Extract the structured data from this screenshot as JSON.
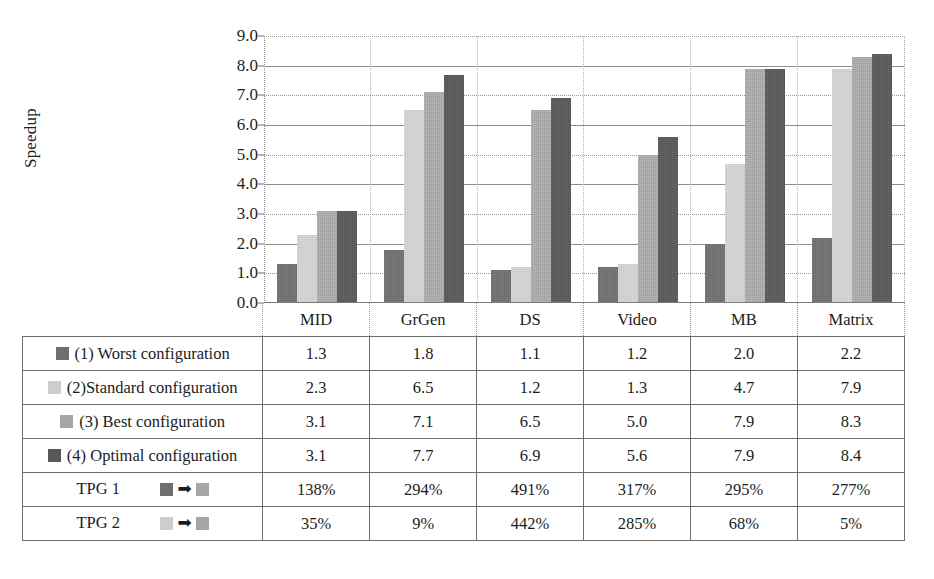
{
  "chart_data": {
    "type": "bar",
    "title": "",
    "xlabel": "",
    "ylabel": "Speedup",
    "ylim": [
      0.0,
      9.0
    ],
    "ytick_step": 1.0,
    "grid": true,
    "legend_position": "table-below",
    "categories": [
      "MID",
      "GrGen",
      "DS",
      "Video",
      "MB",
      "Matrix"
    ],
    "yticks": [
      "9.0",
      "8.0",
      "7.0",
      "6.0",
      "5.0",
      "4.0",
      "3.0",
      "2.0",
      "1.0",
      "0.0"
    ],
    "series": [
      {
        "name": "(1) Worst configuration",
        "color": "#6e6e6e",
        "values": [
          1.3,
          1.8,
          1.1,
          1.2,
          2.0,
          2.2
        ]
      },
      {
        "name": "(2)Standard configuration",
        "color": "#cdcdcd",
        "values": [
          2.3,
          6.5,
          1.2,
          1.3,
          4.7,
          7.9
        ]
      },
      {
        "name": "(3) Best configuration",
        "color": "#a6a6a6",
        "values": [
          3.1,
          7.1,
          6.5,
          5.0,
          7.9,
          8.3
        ]
      },
      {
        "name": "(4) Optimal configuration",
        "color": "#585858",
        "values": [
          3.1,
          7.7,
          6.9,
          5.6,
          7.9,
          8.4
        ]
      }
    ],
    "extra_rows": [
      {
        "name": "TPG 1",
        "from_color": "#6e6e6e",
        "to_color": "#a6a6a6",
        "values": [
          "138%",
          "294%",
          "491%",
          "317%",
          "295%",
          "277%"
        ]
      },
      {
        "name": "TPG 2",
        "from_color": "#cdcdcd",
        "to_color": "#a6a6a6",
        "values": [
          "35%",
          "9%",
          "442%",
          "285%",
          "68%",
          "5%"
        ]
      }
    ]
  },
  "table": {
    "header_blank": "",
    "columns": [
      "MID",
      "GrGen",
      "DS",
      "Video",
      "MB",
      "Matrix"
    ],
    "rows": [
      {
        "label": "(1) Worst configuration",
        "swatch": "s0",
        "values": [
          "1.3",
          "1.8",
          "1.1",
          "1.2",
          "2.0",
          "2.2"
        ]
      },
      {
        "label": "(2)Standard configuration",
        "swatch": "s1",
        "values": [
          "2.3",
          "6.5",
          "1.2",
          "1.3",
          "4.7",
          "7.9"
        ]
      },
      {
        "label": "(3) Best configuration",
        "swatch": "s2",
        "values": [
          "3.1",
          "7.1",
          "6.5",
          "5.0",
          "7.9",
          "8.3"
        ]
      },
      {
        "label": "(4) Optimal configuration",
        "swatch": "s3",
        "values": [
          "3.1",
          "7.7",
          "6.9",
          "5.6",
          "7.9",
          "8.4"
        ]
      }
    ],
    "tpg_rows": [
      {
        "label": "TPG 1",
        "from": "s0",
        "to": "s2",
        "arrow": "➡",
        "values": [
          "138%",
          "294%",
          "491%",
          "317%",
          "295%",
          "277%"
        ]
      },
      {
        "label": "TPG 2",
        "from": "s1",
        "to": "s2",
        "arrow": "➡",
        "values": [
          "35%",
          "9%",
          "442%",
          "285%",
          "68%",
          "5%"
        ]
      }
    ]
  },
  "axis": {
    "y_title": "Speedup"
  }
}
